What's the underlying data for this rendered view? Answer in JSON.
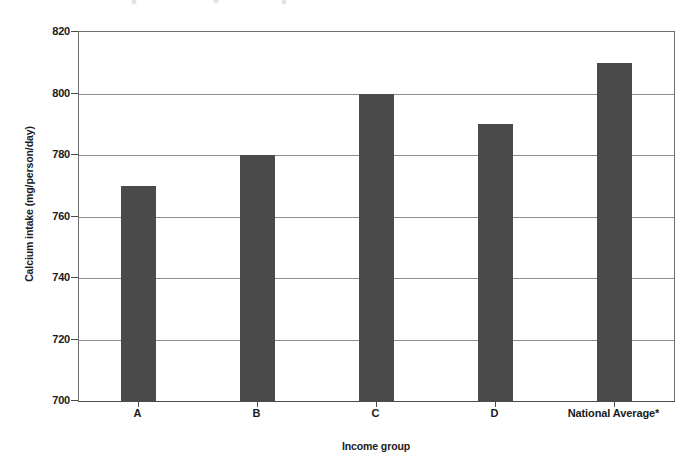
{
  "chart_data": {
    "type": "bar",
    "title": "",
    "categories": [
      "A",
      "B",
      "C",
      "D",
      "National Average*"
    ],
    "values": [
      770,
      780,
      800,
      790,
      810
    ],
    "series": [
      {
        "name": "Calcium intake",
        "values": [
          770,
          780,
          800,
          790,
          810
        ]
      }
    ],
    "xlabel": "Income group",
    "ylabel": "Calcium intake (mg/person/day)",
    "ylim": [
      700,
      820
    ],
    "yticks": [
      700,
      720,
      740,
      760,
      780,
      800,
      820
    ],
    "ytick_labels": [
      "700",
      "720",
      "740",
      "760",
      "780",
      "800",
      "820"
    ],
    "grid": "horizontal",
    "legend": "none",
    "bar_color": "#4a4a4a",
    "axis_color": "#4a4a4a",
    "gridline_color": "#8d8d8d",
    "annotations": [
      "*"
    ]
  }
}
